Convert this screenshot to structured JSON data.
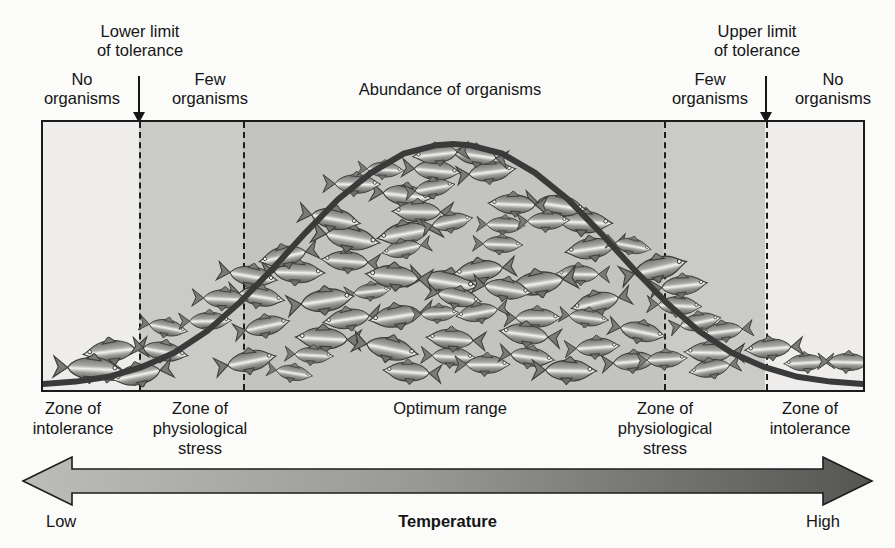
{
  "diagram": {
    "title_axis_y": "Population size",
    "title_axis_x": "Temperature",
    "top_labels": {
      "lower_limit": "Lower limit\nof tolerance",
      "upper_limit": "Upper limit\nof tolerance",
      "no_organisms_left": "No\norganisms",
      "few_organisms_left": "Few\norganisms",
      "abundance": "Abundance of organisms",
      "few_organisms_right": "Few\norganisms",
      "no_organisms_right": "No\norganisms"
    },
    "zone_labels": {
      "zone_intolerance_left": "Zone of\nintolerance",
      "zone_stress_left": "Zone of\nphysiological\nstress",
      "optimum": "Optimum range",
      "zone_stress_right": "Zone of\nphysiological\nstress",
      "zone_intolerance_right": "Zone of\nintolerance"
    },
    "axis_endpoints": {
      "low": "Low",
      "high": "High"
    },
    "colors": {
      "band_outer": "#eeedeb",
      "band_stress": "#c9c9c5",
      "band_optimum": "#c2c2be",
      "curve": "#3a3a3a",
      "arrow_light": "#b9b9b5",
      "arrow_dark": "#5a5a58",
      "ink": "#161616"
    }
  },
  "chart_data": {
    "type": "line",
    "xlabel": "Temperature",
    "ylabel": "Population size",
    "xlim": [
      0,
      100
    ],
    "ylim": [
      0,
      100
    ],
    "grid": false,
    "legend": null,
    "x_tick_labels": [
      "Low",
      "High"
    ],
    "annotations": [
      {
        "text": "Lower limit of tolerance",
        "x": 12,
        "type": "arrow-down"
      },
      {
        "text": "Upper limit of tolerance",
        "x": 88,
        "type": "arrow-down"
      },
      {
        "text": "No organisms",
        "x": 5
      },
      {
        "text": "Few organisms",
        "x": 18
      },
      {
        "text": "Abundance of organisms",
        "x": 50
      },
      {
        "text": "Few organisms",
        "x": 82
      },
      {
        "text": "No organisms",
        "x": 95
      }
    ],
    "zones": [
      {
        "name": "Zone of intolerance",
        "x_start": 0,
        "x_end": 12,
        "shade": "#eeedeb"
      },
      {
        "name": "Zone of physiological stress",
        "x_start": 12,
        "x_end": 24,
        "shade": "#c9c9c5"
      },
      {
        "name": "Optimum range",
        "x_start": 24,
        "x_end": 76,
        "shade": "#c2c2be"
      },
      {
        "name": "Zone of physiological stress",
        "x_start": 76,
        "x_end": 88,
        "shade": "#c9c9c5"
      },
      {
        "name": "Zone of intolerance",
        "x_start": 88,
        "x_end": 100,
        "shade": "#eeedeb"
      }
    ],
    "series": [
      {
        "name": "Population size",
        "x": [
          0,
          4,
          8,
          12,
          16,
          20,
          24,
          28,
          32,
          36,
          40,
          44,
          48,
          50,
          52,
          56,
          60,
          64,
          68,
          72,
          76,
          80,
          84,
          88,
          92,
          96,
          100
        ],
        "values": [
          0,
          1,
          3,
          7,
          13,
          22,
          34,
          48,
          63,
          77,
          88,
          96,
          99.5,
          100,
          99.5,
          96,
          88,
          77,
          63,
          48,
          34,
          22,
          13,
          7,
          3,
          1,
          0
        ]
      }
    ]
  }
}
